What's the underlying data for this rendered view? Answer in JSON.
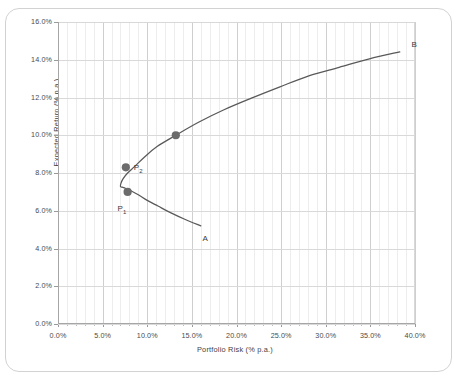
{
  "chart_data": {
    "type": "line",
    "title": "",
    "xlabel": "Portfolio Risk (% p.a.)",
    "ylabel": "Expected Return (% p.a.)",
    "xlim": [
      0.0,
      40.0
    ],
    "ylim": [
      0.0,
      16.0
    ],
    "xticks": [
      "0.0%",
      "5.0%",
      "10.0%",
      "15.0%",
      "20.0%",
      "25.0%",
      "30.0%",
      "35.0%",
      "40.0%"
    ],
    "xtick_values": [
      0.0,
      5.0,
      10.0,
      15.0,
      20.0,
      25.0,
      30.0,
      35.0,
      40.0
    ],
    "yticks": [
      "0.0%",
      "2.0%",
      "4.0%",
      "6.0%",
      "8.0%",
      "10.0%",
      "12.0%",
      "14.0%",
      "16.0%"
    ],
    "ytick_values": [
      0.0,
      2.0,
      4.0,
      6.0,
      8.0,
      10.0,
      12.0,
      14.0,
      16.0
    ],
    "grid": {
      "x_minor_step": 1.0,
      "x_major_step": 5.0,
      "y_major_step": 2.0,
      "horizontal": true,
      "vertical": true
    },
    "legend": null,
    "series": [
      {
        "name": "efficient-frontier",
        "color": "#595959",
        "x": [
          16.0,
          14.2,
          12.6,
          11.2,
          10.0,
          9.0,
          8.2,
          7.6,
          7.2,
          7.0,
          7.05,
          7.3,
          7.8,
          8.6,
          9.7,
          11.1,
          13.2,
          15.8,
          18.6,
          21.6,
          24.8,
          28.1,
          31.5,
          34.9,
          38.3
        ],
        "y": [
          5.2,
          5.55,
          5.9,
          6.25,
          6.55,
          6.85,
          7.05,
          7.18,
          7.25,
          7.28,
          7.45,
          7.7,
          8.0,
          8.35,
          8.85,
          9.4,
          10.0,
          10.7,
          11.35,
          11.95,
          12.55,
          13.15,
          13.6,
          14.05,
          14.42
        ]
      }
    ],
    "markers": [
      {
        "name": "P1",
        "label": "P",
        "sub": "1",
        "x": 7.8,
        "y": 7.0,
        "color": "#6b6b6b"
      },
      {
        "name": "P2",
        "label": "P",
        "sub": "2",
        "x": 7.6,
        "y": 8.3,
        "color": "#6b6b6b"
      },
      {
        "name": "tangency-point",
        "label": "",
        "sub": "",
        "x": 13.2,
        "y": 10.0,
        "color": "#6b6b6b"
      }
    ],
    "annotations": [
      {
        "name": "endpoint-a",
        "text": "A",
        "x": 16.2,
        "y": 4.55
      },
      {
        "name": "endpoint-b",
        "text": "B",
        "x": 39.6,
        "y": 14.85
      }
    ]
  },
  "axes": {
    "y_label": "Expected Return (% p.a.)",
    "x_label": "Portfolio Risk (% p.a.)"
  }
}
